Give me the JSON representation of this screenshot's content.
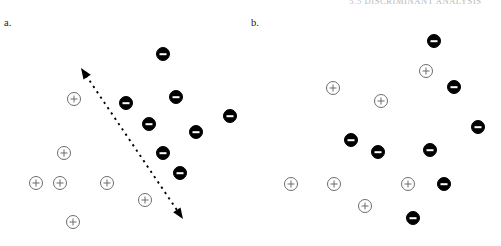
{
  "running_header": "5.5  DISCRIMINANT ANALYSIS",
  "figure": {
    "width": 501,
    "height": 246,
    "background": "#ffffff"
  },
  "legend_symbols": {
    "negative_marker": "filled-circle-minus",
    "positive_marker": "open-circle-plus",
    "negative_color": "#000000",
    "positive_color": "#6d6d6d"
  },
  "panels": [
    {
      "label": "a.",
      "label_x": 4,
      "label_y": 18,
      "has_discriminant_arrow": true,
      "arrow": {
        "name": "discriminant-direction-arrow",
        "style": "dashed-double-headed",
        "x1": 81,
        "y1": 68,
        "x2": 183,
        "y2": 219,
        "color": "#000000"
      },
      "points": [
        {
          "x": 163,
          "y": 54,
          "class": "neg"
        },
        {
          "x": 126,
          "y": 103,
          "class": "neg"
        },
        {
          "x": 176,
          "y": 97,
          "class": "neg"
        },
        {
          "x": 149,
          "y": 124,
          "class": "neg"
        },
        {
          "x": 196,
          "y": 132,
          "class": "neg"
        },
        {
          "x": 230,
          "y": 116,
          "class": "neg"
        },
        {
          "x": 163,
          "y": 153,
          "class": "neg"
        },
        {
          "x": 180,
          "y": 173,
          "class": "neg"
        },
        {
          "x": 74,
          "y": 99,
          "class": "pos"
        },
        {
          "x": 64,
          "y": 153,
          "class": "pos"
        },
        {
          "x": 36,
          "y": 183,
          "class": "pos"
        },
        {
          "x": 60,
          "y": 183,
          "class": "pos"
        },
        {
          "x": 107,
          "y": 183,
          "class": "pos"
        },
        {
          "x": 145,
          "y": 200,
          "class": "pos"
        },
        {
          "x": 73,
          "y": 222,
          "class": "pos"
        }
      ]
    },
    {
      "label": "b.",
      "label_x": 251,
      "label_y": 18,
      "has_discriminant_arrow": false,
      "points": [
        {
          "x": 434,
          "y": 41,
          "class": "neg"
        },
        {
          "x": 454,
          "y": 87,
          "class": "neg"
        },
        {
          "x": 478,
          "y": 127,
          "class": "neg"
        },
        {
          "x": 351,
          "y": 140,
          "class": "neg"
        },
        {
          "x": 378,
          "y": 152,
          "class": "neg"
        },
        {
          "x": 430,
          "y": 150,
          "class": "neg"
        },
        {
          "x": 444,
          "y": 184,
          "class": "neg"
        },
        {
          "x": 413,
          "y": 218,
          "class": "neg"
        },
        {
          "x": 426,
          "y": 71,
          "class": "pos"
        },
        {
          "x": 333,
          "y": 88,
          "class": "pos"
        },
        {
          "x": 381,
          "y": 101,
          "class": "pos"
        },
        {
          "x": 291,
          "y": 184,
          "class": "pos"
        },
        {
          "x": 334,
          "y": 184,
          "class": "pos"
        },
        {
          "x": 408,
          "y": 184,
          "class": "pos"
        },
        {
          "x": 365,
          "y": 206,
          "class": "pos"
        }
      ]
    }
  ],
  "chart_data": {
    "type": "scatter",
    "title": "",
    "xlabel": "",
    "ylabel": "",
    "grid": false,
    "legend_position": "none",
    "annotations": [
      "Panel a: two classes are linearly separable along the dashed arrow direction.",
      "Panel b: the same two classes are intermixed with no separating direction."
    ],
    "series": [
      {
        "name": "negative class (filled minus)",
        "panel": "a.",
        "marker": "filled-circle-minus",
        "color": "#000000",
        "points": [
          [
            163,
            54
          ],
          [
            126,
            103
          ],
          [
            176,
            97
          ],
          [
            149,
            124
          ],
          [
            196,
            132
          ],
          [
            230,
            116
          ],
          [
            163,
            153
          ],
          [
            180,
            173
          ]
        ]
      },
      {
        "name": "positive class (open plus)",
        "panel": "a.",
        "marker": "open-circle-plus",
        "color": "#6d6d6d",
        "points": [
          [
            74,
            99
          ],
          [
            64,
            153
          ],
          [
            36,
            183
          ],
          [
            60,
            183
          ],
          [
            107,
            183
          ],
          [
            145,
            200
          ],
          [
            73,
            222
          ]
        ]
      },
      {
        "name": "negative class (filled minus)",
        "panel": "b.",
        "marker": "filled-circle-minus",
        "color": "#000000",
        "points": [
          [
            434,
            41
          ],
          [
            454,
            87
          ],
          [
            478,
            127
          ],
          [
            351,
            140
          ],
          [
            378,
            152
          ],
          [
            430,
            150
          ],
          [
            444,
            184
          ],
          [
            413,
            218
          ]
        ]
      },
      {
        "name": "positive class (open plus)",
        "panel": "b.",
        "marker": "open-circle-plus",
        "color": "#6d6d6d",
        "points": [
          [
            426,
            71
          ],
          [
            333,
            88
          ],
          [
            381,
            101
          ],
          [
            291,
            184
          ],
          [
            334,
            184
          ],
          [
            408,
            184
          ],
          [
            365,
            206
          ]
        ]
      }
    ]
  }
}
